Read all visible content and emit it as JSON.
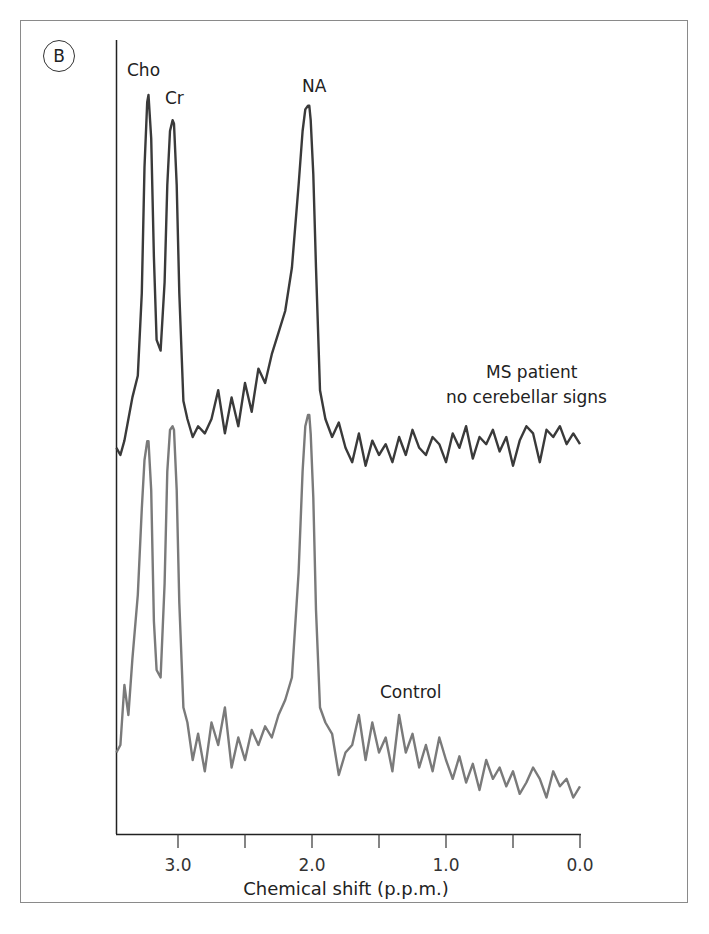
{
  "panel": {
    "label": "B"
  },
  "chart_data": {
    "type": "line",
    "title": "",
    "xlabel": "Chemical shift (p.p.m.)",
    "ylabel": "",
    "x_axis": {
      "reversed": true,
      "range": [
        3.46,
        0.0
      ],
      "major_ticks": [
        3.0,
        2.0,
        1.0,
        0.0
      ],
      "major_tick_labels": [
        "3.0",
        "2.0",
        "1.0",
        "0.0"
      ],
      "minor_ticks": [
        3.5,
        2.5,
        1.5,
        0.5
      ]
    },
    "grid": false,
    "legend": "none (inline series labels)",
    "peak_labels": [
      {
        "name": "Cho",
        "ppm": 3.22
      },
      {
        "name": "Cr",
        "ppm": 3.03
      },
      {
        "name": "NA",
        "ppm": 2.02
      }
    ],
    "series": [
      {
        "name": "MS patient no cerebellar signs",
        "label_lines": [
          "MS patient",
          "no cerebellar signs"
        ],
        "color": "#3a3a3a",
        "relative_intensity": {
          "Cho": 1.0,
          "Cr": 0.93,
          "NA": 0.97
        },
        "x": [
          3.46,
          3.43,
          3.4,
          3.37,
          3.34,
          3.3,
          3.27,
          3.25,
          3.23,
          3.22,
          3.2,
          3.18,
          3.16,
          3.13,
          3.1,
          3.08,
          3.06,
          3.04,
          3.03,
          3.01,
          2.99,
          2.96,
          2.93,
          2.89,
          2.85,
          2.8,
          2.75,
          2.7,
          2.65,
          2.6,
          2.55,
          2.5,
          2.45,
          2.4,
          2.35,
          2.3,
          2.25,
          2.2,
          2.15,
          2.1,
          2.07,
          2.05,
          2.03,
          2.02,
          2.01,
          1.99,
          1.97,
          1.94,
          1.9,
          1.85,
          1.8,
          1.75,
          1.7,
          1.65,
          1.6,
          1.55,
          1.5,
          1.45,
          1.4,
          1.35,
          1.3,
          1.25,
          1.2,
          1.15,
          1.1,
          1.05,
          1.0,
          0.95,
          0.9,
          0.85,
          0.8,
          0.75,
          0.7,
          0.65,
          0.6,
          0.55,
          0.5,
          0.45,
          0.4,
          0.35,
          0.3,
          0.25,
          0.2,
          0.15,
          0.1,
          0.05,
          0.0
        ],
        "y": [
          0.02,
          0.0,
          0.04,
          0.1,
          0.16,
          0.22,
          0.45,
          0.8,
          0.98,
          1.0,
          0.88,
          0.55,
          0.32,
          0.29,
          0.48,
          0.75,
          0.9,
          0.93,
          0.92,
          0.75,
          0.45,
          0.15,
          0.1,
          0.05,
          0.08,
          0.06,
          0.1,
          0.18,
          0.06,
          0.16,
          0.08,
          0.2,
          0.12,
          0.24,
          0.2,
          0.28,
          0.34,
          0.4,
          0.52,
          0.75,
          0.9,
          0.96,
          0.97,
          0.97,
          0.93,
          0.78,
          0.52,
          0.18,
          0.1,
          0.05,
          0.09,
          0.02,
          -0.02,
          0.06,
          -0.03,
          0.04,
          0.0,
          0.03,
          -0.02,
          0.05,
          0.0,
          0.07,
          0.02,
          0.0,
          0.05,
          0.03,
          -0.02,
          0.06,
          0.02,
          0.08,
          -0.01,
          0.05,
          0.03,
          0.07,
          0.01,
          0.05,
          -0.03,
          0.04,
          0.08,
          0.06,
          -0.02,
          0.07,
          0.05,
          0.08,
          0.03,
          0.06,
          0.03
        ]
      },
      {
        "name": "Control",
        "label_lines": [
          "Control"
        ],
        "color": "#7a7a7a",
        "relative_intensity": {
          "Cho": 0.93,
          "Cr": 0.97,
          "NA": 1.0
        },
        "x": [
          3.46,
          3.43,
          3.4,
          3.37,
          3.34,
          3.3,
          3.27,
          3.25,
          3.23,
          3.22,
          3.2,
          3.18,
          3.16,
          3.13,
          3.1,
          3.08,
          3.06,
          3.04,
          3.03,
          3.01,
          2.99,
          2.96,
          2.93,
          2.89,
          2.85,
          2.8,
          2.75,
          2.7,
          2.65,
          2.6,
          2.55,
          2.5,
          2.45,
          2.4,
          2.35,
          2.3,
          2.25,
          2.2,
          2.15,
          2.1,
          2.07,
          2.05,
          2.03,
          2.02,
          2.01,
          1.99,
          1.97,
          1.94,
          1.9,
          1.85,
          1.8,
          1.75,
          1.7,
          1.65,
          1.6,
          1.55,
          1.5,
          1.45,
          1.4,
          1.35,
          1.3,
          1.25,
          1.2,
          1.15,
          1.1,
          1.05,
          1.0,
          0.95,
          0.9,
          0.85,
          0.8,
          0.75,
          0.7,
          0.65,
          0.6,
          0.55,
          0.5,
          0.45,
          0.4,
          0.35,
          0.3,
          0.25,
          0.2,
          0.15,
          0.1,
          0.05,
          0.0
        ],
        "y": [
          0.1,
          0.12,
          0.28,
          0.2,
          0.35,
          0.52,
          0.75,
          0.88,
          0.93,
          0.93,
          0.8,
          0.45,
          0.32,
          0.3,
          0.55,
          0.85,
          0.96,
          0.97,
          0.96,
          0.8,
          0.5,
          0.22,
          0.18,
          0.08,
          0.15,
          0.05,
          0.18,
          0.12,
          0.22,
          0.06,
          0.14,
          0.08,
          0.16,
          0.12,
          0.17,
          0.14,
          0.2,
          0.24,
          0.3,
          0.58,
          0.85,
          0.97,
          1.0,
          1.0,
          0.95,
          0.78,
          0.48,
          0.22,
          0.18,
          0.15,
          0.04,
          0.1,
          0.12,
          0.2,
          0.08,
          0.18,
          0.1,
          0.14,
          0.05,
          0.2,
          0.1,
          0.15,
          0.06,
          0.12,
          0.05,
          0.14,
          0.08,
          0.03,
          0.09,
          0.02,
          0.07,
          0.0,
          0.08,
          0.03,
          0.06,
          0.01,
          0.05,
          -0.01,
          0.02,
          0.06,
          0.03,
          -0.02,
          0.05,
          0.01,
          0.03,
          -0.02,
          0.01
        ]
      }
    ]
  },
  "colors": {
    "series_ms": "#3a3a3a",
    "series_control": "#7a7a7a",
    "axis": "#222222",
    "frame": "#8a8a8a"
  }
}
